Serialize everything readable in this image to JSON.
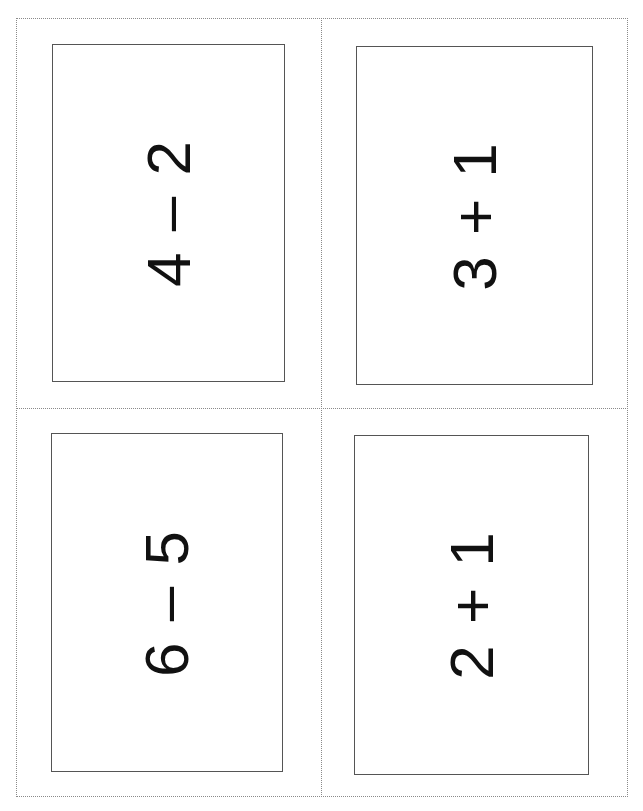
{
  "sheet": {
    "layout": "2x2 flash-card cut sheet",
    "cards": [
      {
        "position": "top-left",
        "expression": "4 – 2",
        "operation": "subtraction"
      },
      {
        "position": "top-right",
        "expression": "3 + 1",
        "operation": "addition"
      },
      {
        "position": "bottom-left",
        "expression": "6 – 5",
        "operation": "subtraction"
      },
      {
        "position": "bottom-right",
        "expression": "2 + 1",
        "operation": "addition"
      }
    ]
  },
  "colors": {
    "background": "#ffffff",
    "text": "#111111",
    "card_border": "#555555",
    "cut_line": "#8a8a8a"
  }
}
